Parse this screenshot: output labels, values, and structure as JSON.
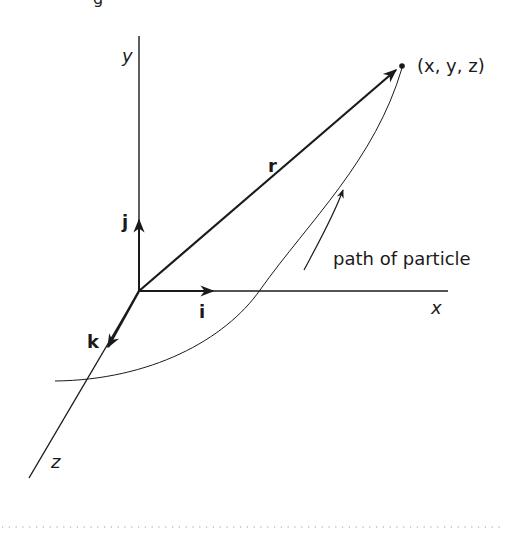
{
  "figure": {
    "title_fragment": "g",
    "axes": {
      "x_label": "x",
      "y_label": "y",
      "z_label": "z"
    },
    "unit_vectors": {
      "i": "i",
      "j": "j",
      "k": "k"
    },
    "position_vector": "r",
    "point_label": "(x, y, z)",
    "path_label": "path of particle",
    "colors": {
      "ink": "#1a1a1a",
      "background": "#ffffff",
      "dotted_rule": "#9a9a9a"
    }
  }
}
